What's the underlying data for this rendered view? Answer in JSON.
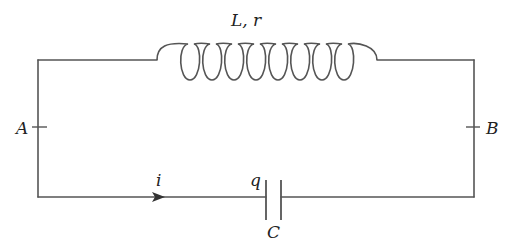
{
  "diagram": {
    "type": "RLC-circuit",
    "labels": {
      "inductor": "L, r",
      "node_a": "A",
      "node_b": "B",
      "current": "i",
      "charge": "q",
      "capacitor": "C"
    },
    "components": [
      {
        "kind": "inductor",
        "label": "L, r",
        "position": "top",
        "turns": 8
      },
      {
        "kind": "capacitor",
        "label": "C",
        "charge_label": "q",
        "position": "bottom"
      },
      {
        "kind": "node",
        "label": "A",
        "position": "left"
      },
      {
        "kind": "node",
        "label": "B",
        "position": "right"
      },
      {
        "kind": "current-arrow",
        "label": "i",
        "direction": "right",
        "position": "bottom-left"
      }
    ],
    "colors": {
      "wire": "#555555",
      "text": "#222222",
      "background": "#ffffff"
    }
  }
}
